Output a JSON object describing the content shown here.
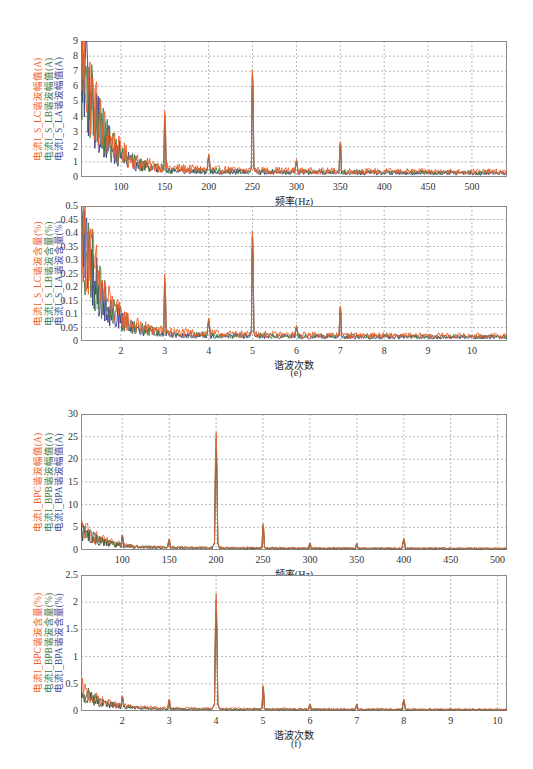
{
  "figure_captions": {
    "e": "(e)",
    "f": "(f)"
  },
  "chart_data": [
    {
      "id": "e-top",
      "type": "line",
      "title": "",
      "xlabel": "频率(Hz)",
      "ylabels": [
        {
          "text": "电流I_S_LC谐波幅值(A)",
          "color": "#f0602a"
        },
        {
          "text": "电流I_S_LB谐波幅值(A)",
          "color": "#3f7a3f"
        },
        {
          "text": "电流I_S_LA谐波幅值(A)",
          "color": "#4a4a9a"
        }
      ],
      "xlim": [
        54.5,
        540
      ],
      "ylim": [
        0,
        9
      ],
      "xticks": [
        100,
        150,
        200,
        250,
        300,
        350,
        400,
        450,
        500
      ],
      "yticks": [
        0,
        1,
        2,
        3,
        4,
        5,
        6,
        7,
        8,
        9
      ],
      "grid": true,
      "series": [
        {
          "name": "I_S_LC",
          "color": "#f0602a",
          "noise_floor": 0.55,
          "decay_start": 8.6
        },
        {
          "name": "I_S_LB",
          "color": "#3f7a3f",
          "noise_floor": 0.45,
          "decay_start": 8.2
        },
        {
          "name": "I_S_LA",
          "color": "#3a3a8c",
          "noise_floor": 0.4,
          "decay_start": 7.8
        }
      ],
      "peaks": [
        {
          "x": 100,
          "y": 1.9
        },
        {
          "x": 150,
          "y": 4.8
        },
        {
          "x": 200,
          "y": 1.6
        },
        {
          "x": 250,
          "y": 8.0
        },
        {
          "x": 300,
          "y": 1.2
        },
        {
          "x": 350,
          "y": 2.7
        }
      ]
    },
    {
      "id": "e-bottom",
      "type": "line",
      "title": "",
      "xlabel": "谐波次数",
      "ylabels": [
        {
          "text": "电流I_S_LC谐波含量(%)",
          "color": "#f0602a"
        },
        {
          "text": "电流I_S_LB谐波含量(%)",
          "color": "#3f7a3f"
        },
        {
          "text": "电流I_S_LA谐波含量(%)",
          "color": "#4a4a9a"
        }
      ],
      "xlim": [
        1.09,
        10.8
      ],
      "ylim": [
        0,
        0.5
      ],
      "xticks": [
        2,
        3,
        4,
        5,
        6,
        7,
        8,
        9,
        10
      ],
      "yticks": [
        0,
        0.05,
        0.1,
        0.15,
        0.2,
        0.25,
        0.3,
        0.35,
        0.4,
        0.45,
        0.5
      ],
      "grid": true,
      "series": [
        {
          "name": "I_S_LC",
          "color": "#f0602a",
          "noise_floor": 0.03,
          "decay_start": 0.48
        },
        {
          "name": "I_S_LB",
          "color": "#3f7a3f",
          "noise_floor": 0.025,
          "decay_start": 0.45
        },
        {
          "name": "I_S_LA",
          "color": "#3a3a8c",
          "noise_floor": 0.022,
          "decay_start": 0.43
        }
      ],
      "peaks": [
        {
          "x": 2,
          "y": 0.1
        },
        {
          "x": 3,
          "y": 0.27
        },
        {
          "x": 4,
          "y": 0.09
        },
        {
          "x": 5,
          "y": 0.46
        },
        {
          "x": 6,
          "y": 0.06
        },
        {
          "x": 7,
          "y": 0.15
        }
      ]
    },
    {
      "id": "f-top",
      "type": "line",
      "title": "",
      "xlabel": "频率(Hz)",
      "ylabels": [
        {
          "text": "电流I_BPC谐波幅值(A)",
          "color": "#f0602a"
        },
        {
          "text": "电流I_BPB谐波幅值(A)",
          "color": "#3f7a3f"
        },
        {
          "text": "电流I_BPA谐波幅值(A)",
          "color": "#4a4a9a"
        }
      ],
      "xlim": [
        56,
        510
      ],
      "ylim": [
        0,
        30
      ],
      "xticks": [
        100,
        150,
        200,
        250,
        300,
        350,
        400,
        450,
        500
      ],
      "yticks": [
        0,
        5,
        10,
        15,
        20,
        25,
        30
      ],
      "grid": true,
      "series": [
        {
          "name": "I_BPC",
          "color": "#e0643a",
          "noise_floor": 0.6,
          "decay_start": 5.0
        },
        {
          "name": "I_BPB",
          "color": "#4a6a3a",
          "noise_floor": 0.5,
          "decay_start": 4.6
        },
        {
          "name": "I_BPA",
          "color": "#3a3a3a",
          "noise_floor": 0.45,
          "decay_start": 4.3
        }
      ],
      "peaks": [
        {
          "x": 100,
          "y": 3.8
        },
        {
          "x": 150,
          "y": 2.8
        },
        {
          "x": 200,
          "y": 26.5
        },
        {
          "x": 250,
          "y": 6.2
        },
        {
          "x": 300,
          "y": 1.8
        },
        {
          "x": 350,
          "y": 1.6
        },
        {
          "x": 400,
          "y": 2.6
        }
      ]
    },
    {
      "id": "f-bottom",
      "type": "line",
      "title": "",
      "xlabel": "谐波次数",
      "ylabels": [
        {
          "text": "电流I_BPC谐波含量(%)",
          "color": "#f0602a"
        },
        {
          "text": "电流I_BPB谐波含量(%)",
          "color": "#3f7a3f"
        },
        {
          "text": "电流I_BPA谐波含量(%)",
          "color": "#4a4a9a"
        }
      ],
      "xlim": [
        1.12,
        10.2
      ],
      "ylim": [
        0,
        2.5
      ],
      "xticks": [
        2,
        3,
        4,
        5,
        6,
        7,
        8,
        9,
        10
      ],
      "yticks": [
        0,
        0.5,
        1,
        1.5,
        2,
        2.5
      ],
      "grid": true,
      "series": [
        {
          "name": "I_BPC",
          "color": "#e0643a",
          "noise_floor": 0.05,
          "decay_start": 0.4
        },
        {
          "name": "I_BPB",
          "color": "#4a6a3a",
          "noise_floor": 0.04,
          "decay_start": 0.37
        },
        {
          "name": "I_BPA",
          "color": "#3a3a3a",
          "noise_floor": 0.035,
          "decay_start": 0.35
        }
      ],
      "peaks": [
        {
          "x": 2,
          "y": 0.32
        },
        {
          "x": 3,
          "y": 0.25
        },
        {
          "x": 4,
          "y": 2.2
        },
        {
          "x": 5,
          "y": 0.5
        },
        {
          "x": 6,
          "y": 0.15
        },
        {
          "x": 7,
          "y": 0.14
        },
        {
          "x": 8,
          "y": 0.22
        }
      ]
    }
  ]
}
